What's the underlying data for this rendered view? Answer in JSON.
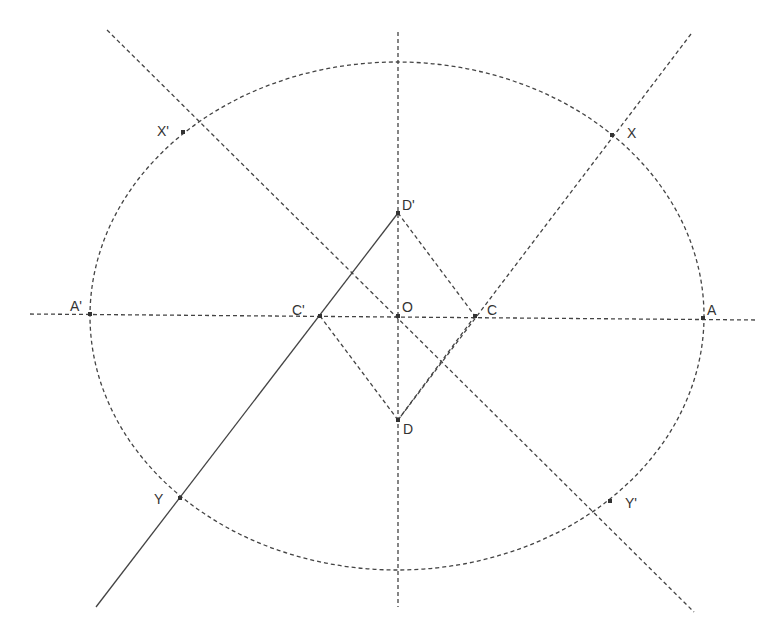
{
  "diagram": {
    "title": "",
    "stroke_color": "#444444",
    "background": "#ffffff",
    "ellipse": {
      "cx": 397,
      "cy": 316,
      "rx": 307,
      "ry": 254
    },
    "lines": [
      {
        "name": "horizontal-axis",
        "x1": 30,
        "y1": 314,
        "x2": 757,
        "y2": 320,
        "style": "dashed"
      },
      {
        "name": "vertical-axis",
        "x1": 398,
        "y1": 32,
        "x2": 398,
        "y2": 607,
        "style": "dashed"
      },
      {
        "name": "line-x-prime-c",
        "x1": 107,
        "y1": 30,
        "x2": 694,
        "y2": 612,
        "style": "dashed"
      },
      {
        "name": "line-c-x",
        "x1": 691,
        "y1": 34,
        "x2": 398,
        "y2": 420,
        "style": "dashed"
      },
      {
        "name": "line-d-c",
        "x1": 398,
        "y1": 420,
        "x2": 475,
        "y2": 316,
        "style": "dashed"
      },
      {
        "name": "line-d-prime-c",
        "x1": 398,
        "y1": 213,
        "x2": 475,
        "y2": 316,
        "style": "dashed"
      },
      {
        "name": "line-d-c-prime",
        "x1": 398,
        "y1": 420,
        "x2": 320,
        "y2": 316,
        "style": "dashed"
      },
      {
        "name": "line-d-prime-y",
        "x1": 398,
        "y1": 213,
        "x2": 96,
        "y2": 607,
        "style": "solid"
      }
    ],
    "points": [
      {
        "id": "A",
        "label": "A",
        "x": 703,
        "y": 318,
        "lx": 707,
        "ly": 315
      },
      {
        "id": "A-prime",
        "label": "A'",
        "x": 90,
        "y": 314,
        "lx": 70,
        "ly": 311
      },
      {
        "id": "O",
        "label": "O",
        "x": 398,
        "y": 316,
        "lx": 402,
        "ly": 312
      },
      {
        "id": "C",
        "label": "C",
        "x": 475,
        "y": 316,
        "lx": 487,
        "ly": 315
      },
      {
        "id": "C-prime",
        "label": "C'",
        "x": 320,
        "y": 316,
        "lx": 292,
        "ly": 315
      },
      {
        "id": "D",
        "label": "D",
        "x": 398,
        "y": 420,
        "lx": 403,
        "ly": 434
      },
      {
        "id": "D-prime",
        "label": "D'",
        "x": 398,
        "y": 213,
        "lx": 402,
        "ly": 210
      },
      {
        "id": "X",
        "label": "X",
        "x": 612,
        "y": 135,
        "lx": 627,
        "ly": 138
      },
      {
        "id": "X-prime",
        "label": "X'",
        "x": 183,
        "y": 132,
        "lx": 157,
        "ly": 136
      },
      {
        "id": "Y",
        "label": "Y",
        "x": 180,
        "y": 498,
        "lx": 154,
        "ly": 504
      },
      {
        "id": "Y-prime",
        "label": "Y'",
        "x": 610,
        "y": 501,
        "lx": 625,
        "ly": 508
      }
    ]
  }
}
